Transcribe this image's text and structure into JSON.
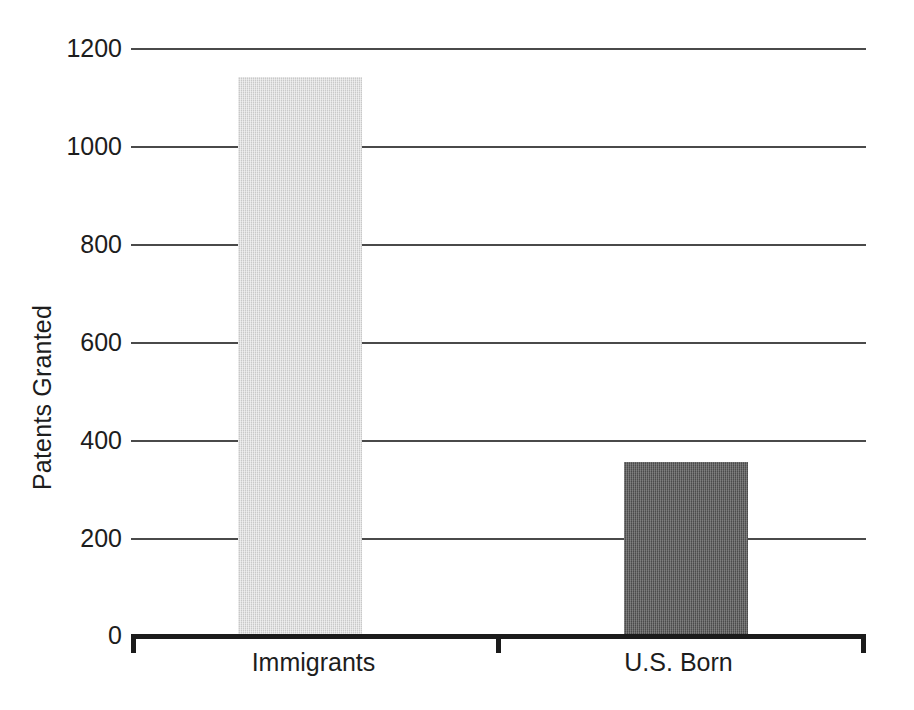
{
  "chart_data": {
    "type": "bar",
    "title": "",
    "subtitle": "",
    "xlabel": "",
    "ylabel": "Patents Granted",
    "categories": [
      "Immigrants",
      "U.S. Born"
    ],
    "values": [
      1140,
      355
    ],
    "series": [
      {
        "name": "Patents Granted",
        "values": [
          1140,
          355
        ]
      }
    ],
    "ylim": [
      0,
      1200
    ],
    "ytick_labels": [
      "1200",
      "1000",
      "800",
      "600",
      "400",
      "200",
      "0"
    ],
    "ytick_values": [
      1200,
      1000,
      800,
      600,
      400,
      200,
      0
    ],
    "grid": true,
    "grid_axis": "y",
    "legend": false,
    "legend_position": "none",
    "annotations": [],
    "bar_colors": [
      "#c9c9c9",
      "#5c5c5c"
    ],
    "axis_color": "#1b1b1b",
    "gridline_color": "#4a4a4a",
    "background_color": "#ffffff"
  },
  "axes": {
    "y_title": "Patents Granted",
    "ticks": [
      {
        "label": "1200",
        "value": 1200
      },
      {
        "label": "1000",
        "value": 1000
      },
      {
        "label": "800",
        "value": 800
      },
      {
        "label": "600",
        "value": 600
      },
      {
        "label": "400",
        "value": 400
      },
      {
        "label": "200",
        "value": 200
      },
      {
        "label": "0",
        "value": 0
      }
    ],
    "categories": [
      {
        "label": "Immigrants",
        "value": 1140
      },
      {
        "label": "U.S. Born",
        "value": 355
      }
    ]
  }
}
